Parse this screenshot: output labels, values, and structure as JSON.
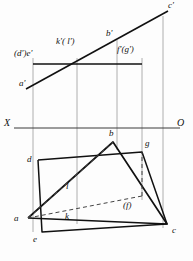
{
  "figure": {
    "type": "engineering-line-drawing",
    "width": 193,
    "height": 261,
    "colors": {
      "line": "#111111",
      "thin_line": "#8a8a8a",
      "dashed": "#555555",
      "background": "#fdfdfd"
    }
  },
  "axis": {
    "x_label": "X",
    "o_label": "O",
    "ground_line_y": 128,
    "x_label_pos": {
      "x": 4,
      "y": 119
    },
    "o_label_pos": {
      "x": 178,
      "y": 119
    }
  },
  "labels": {
    "c_prime": "c'",
    "b_prime": "b'",
    "a_prime": "a'",
    "de_prime": "(d')e'",
    "kl_prime": "k'( l')",
    "fg_prime": "f'(g')",
    "d": "d",
    "b": "b",
    "g": "g",
    "l": "l",
    "a": "a",
    "k": "k",
    "e": "e",
    "c": "c",
    "f_paren": "(f)"
  },
  "label_positions": {
    "c_prime": {
      "x": 168,
      "y": 2
    },
    "b_prime": {
      "x": 106,
      "y": 30
    },
    "a_prime": {
      "x": 20,
      "y": 80
    },
    "de_prime": {
      "x": 16,
      "y": 50
    },
    "kl_prime": {
      "x": 56,
      "y": 38
    },
    "fg_prime": {
      "x": 118,
      "y": 46
    },
    "d": {
      "x": 28,
      "y": 166
    },
    "b": {
      "x": 109,
      "y": 130
    },
    "g": {
      "x": 145,
      "y": 140
    },
    "l": {
      "x": 66,
      "y": 186
    },
    "a": {
      "x": 15,
      "y": 215
    },
    "k": {
      "x": 66,
      "y": 213
    },
    "e": {
      "x": 33,
      "y": 238
    },
    "c": {
      "x": 173,
      "y": 228
    },
    "f_paren": {
      "x": 124,
      "y": 203
    }
  },
  "points_top_view": {
    "a_prime": {
      "x": 33,
      "y": 87
    },
    "b_prime": {
      "x": 117,
      "y": 44
    },
    "c_prime": {
      "x": 163,
      "y": 20
    },
    "d_prime": {
      "x": 33,
      "y": 64
    },
    "e_prime": {
      "x": 33,
      "y": 64
    },
    "f_prime": {
      "x": 142,
      "y": 64
    },
    "g_prime": {
      "x": 142,
      "y": 64
    },
    "k_prime": {
      "x": 77,
      "y": 64
    },
    "l_prime": {
      "x": 77,
      "y": 64
    }
  },
  "points_front_view": {
    "a": {
      "x": 28,
      "y": 218
    },
    "b": {
      "x": 113,
      "y": 142
    },
    "c": {
      "x": 167,
      "y": 224
    },
    "d": {
      "x": 38,
      "y": 160
    },
    "e": {
      "x": 42,
      "y": 232
    },
    "f": {
      "x": 142,
      "y": 196
    },
    "g": {
      "x": 142,
      "y": 152
    },
    "k": {
      "x": 77,
      "y": 218
    },
    "l": {
      "x": 73,
      "y": 183
    }
  },
  "projection_lines": [
    {
      "name": "through-a-d-e",
      "x": 33
    },
    {
      "name": "through-k-l",
      "x": 77
    },
    {
      "name": "through-b",
      "x": 117
    },
    {
      "name": "through-f-g",
      "x": 142
    },
    {
      "name": "through-c",
      "x": 163
    }
  ],
  "elements": {
    "upper_triangle_line": "a'-b'-c' inclined straight line",
    "upper_rectangle": "d'e' to f'g' horizontal band",
    "lower_triangle": "a-b-c solid triangle",
    "lower_parallelogram": "d-e-c-g plane",
    "hidden_lines": "k-l and f dashed edges"
  }
}
